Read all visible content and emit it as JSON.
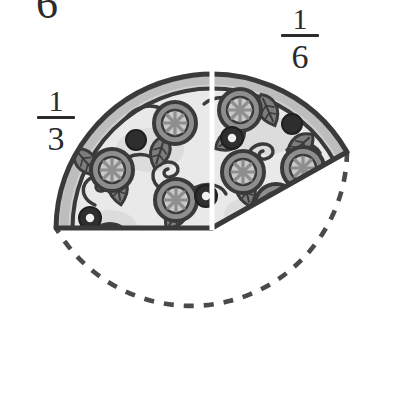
{
  "page": {
    "background_color": "#ffffff"
  },
  "labels": {
    "left_fraction": {
      "name": "one-third",
      "numerator": "1",
      "denominator": "3"
    },
    "right_fraction": {
      "name": "one-sixth",
      "numerator": "1",
      "denominator": "6"
    },
    "clipped_top_glyph": "6"
  },
  "figure": {
    "type": "circle-fraction-model",
    "center_x": 212,
    "center_y": 228,
    "radius": 156,
    "shaded_portion": "1/2",
    "shaded_start_angle_deg": 180,
    "shaded_end_angle_deg": 330,
    "divider": {
      "name": "white-split-line",
      "color": "#ffffff",
      "angle_deg": 270,
      "width_px": 4
    },
    "missing_portion": {
      "name": "dashed-outline",
      "style": "dashed",
      "color": "#4a4a4a",
      "dash": "9 9",
      "stroke_width": 4
    },
    "pieces": [
      {
        "name": "left-piece",
        "fraction": "1/3",
        "angle_span_deg": 120
      },
      {
        "name": "right-piece",
        "fraction": "1/6",
        "angle_span_deg": 60
      }
    ]
  },
  "colors": {
    "outline": "#3a3a3a",
    "crust_light": "#d2d2d2",
    "crust_mid": "#a9a9a9",
    "cheese": "#e9e9e9",
    "topping_mid": "#8e8e8e",
    "topping_dark": "#2e2e2e",
    "leaf": "#777777",
    "dashed": "#4a4a4a",
    "text": "#2b2b2b"
  }
}
